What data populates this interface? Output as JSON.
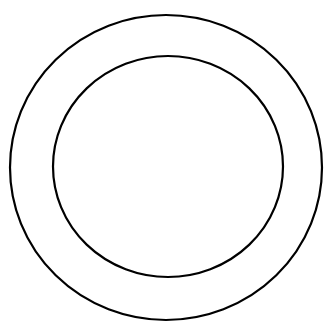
{
  "diagram": {
    "background": "#ffffff",
    "stroke_color": "#000000",
    "shapes": [
      {
        "id": "outer-circle",
        "cx": 166,
        "cy": 167.5,
        "rx": 156,
        "ry": 152.5,
        "stroke_width": 2.2
      },
      {
        "id": "inner-circle",
        "cx": 168,
        "cy": 166.5,
        "rx": 115,
        "ry": 110.5,
        "stroke_width": 2.2
      }
    ]
  }
}
